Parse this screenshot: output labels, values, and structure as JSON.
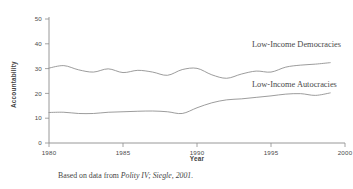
{
  "figure": {
    "caption_prefix": "Based on data from ",
    "caption_source": "Polity IV; Siegle, 2001."
  },
  "chart_data": {
    "type": "line",
    "title": "",
    "xlabel": "Year",
    "ylabel": "Accountability",
    "xlim": [
      1980,
      2000
    ],
    "ylim": [
      0,
      50
    ],
    "xticks": [
      1980,
      1985,
      1990,
      1995,
      2000
    ],
    "yticks": [
      0,
      10,
      20,
      30,
      40,
      50
    ],
    "grid": false,
    "legend_position": "inline-right",
    "line_color": "#8a8a8a",
    "x": [
      1980,
      1981,
      1982,
      1983,
      1984,
      1985,
      1986,
      1987,
      1988,
      1989,
      1990,
      1991,
      1992,
      1993,
      1994,
      1995,
      1996,
      1997,
      1998,
      1999
    ],
    "series": [
      {
        "name": "Low-Income Democracies",
        "label": "Low-Income Democracies",
        "values": [
          30.2,
          31.2,
          29.5,
          28.6,
          29.9,
          28.4,
          29.3,
          28.6,
          27.3,
          29.6,
          30.1,
          27.5,
          26.1,
          27.8,
          29.0,
          28.6,
          30.6,
          31.4,
          31.8,
          32.4
        ]
      },
      {
        "name": "Low-Income Autocracies",
        "label": "Low-Income Autocracies",
        "values": [
          12.3,
          12.4,
          11.9,
          11.9,
          12.4,
          12.6,
          12.8,
          12.9,
          12.6,
          11.9,
          14.2,
          16.2,
          17.4,
          17.8,
          18.4,
          19.0,
          19.7,
          19.9,
          19.2,
          20.2
        ]
      }
    ]
  }
}
